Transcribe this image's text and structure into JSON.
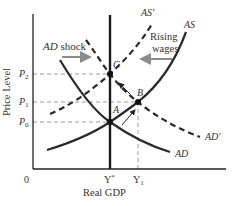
{
  "diagram": {
    "type": "AS-AD model",
    "axes": {
      "x_label": "Real GDP",
      "y_label": "Price Level",
      "origin_label": "0",
      "x_ticks": [
        {
          "label": "Y",
          "sup": "*",
          "x": 110
        },
        {
          "label": "Y",
          "sub": "1",
          "x": 138
        }
      ],
      "y_ticks": [
        {
          "label": "P",
          "sub": "2",
          "y": 74
        },
        {
          "label": "P",
          "sub": "1",
          "y": 102
        },
        {
          "label": "P",
          "sub": "0",
          "y": 122
        }
      ]
    },
    "curves": [
      {
        "name": "AS",
        "style": "solid"
      },
      {
        "name": "AS'",
        "style": "dashed"
      },
      {
        "name": "AD",
        "style": "solid"
      },
      {
        "name": "AD'",
        "style": "dashed"
      },
      {
        "name": "LRAS",
        "style": "solid-vertical",
        "at": "Y*"
      }
    ],
    "points": [
      {
        "name": "A",
        "x": 110,
        "y": 122
      },
      {
        "name": "B",
        "x": 138,
        "y": 102
      },
      {
        "name": "C",
        "x": 110,
        "y": 74
      }
    ],
    "annotations": {
      "ad_shock": "AD shock",
      "rising_wages_line1": "Rising",
      "rising_wages_line2": "wages"
    },
    "labels": {
      "as": "AS",
      "as_prime": "AS'",
      "ad": "AD",
      "ad_prime": "AD'",
      "a": "A",
      "b": "B",
      "c": "C",
      "p": "P",
      "p2_sub": "2",
      "p1_sub": "1",
      "p0_sub": "0",
      "y": "Y",
      "ystar_sup": "*",
      "y1_sub": "1"
    },
    "colors": {
      "axis": "#222222",
      "curve": "#2a2a2a",
      "guide": "#9a9a9a",
      "arrow_gray": "#8c8c8c",
      "text": "#333333"
    }
  }
}
